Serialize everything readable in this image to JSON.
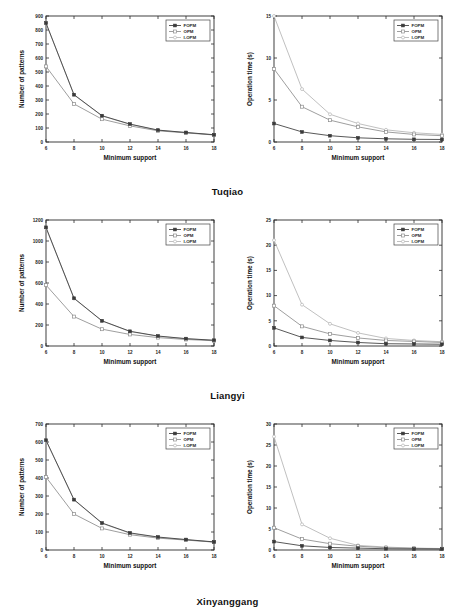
{
  "figure": {
    "x_label": "Minimum support",
    "y_label_patterns": "Number of patterns",
    "y_label_time": "Operation time (s)",
    "legend": [
      "FOPM",
      "OPM",
      "I-OPM"
    ],
    "colors": {
      "FOPM": "#3a3a3a",
      "OPM": "#8c8c8c",
      "I-OPM": "#b5b5b5",
      "axis": "#2b2b2b",
      "background": "#ffffff"
    },
    "captions": [
      "Tuqiao",
      "Liangyi",
      "Xinyanggang"
    ]
  },
  "chart_data": [
    {
      "type": "line",
      "panel": "tuqiao-patterns",
      "title": "",
      "dataset": "Tuqiao",
      "xlabel": "Minimum support",
      "ylabel": "Number of patterns",
      "x": [
        6,
        8,
        10,
        12,
        14,
        16,
        18
      ],
      "xlim": [
        6,
        18
      ],
      "ylim": [
        0,
        900
      ],
      "xticks": [
        6,
        8,
        10,
        12,
        14,
        16,
        18
      ],
      "yticks": [
        0,
        100,
        200,
        300,
        400,
        500,
        600,
        700,
        800,
        900
      ],
      "grid": false,
      "legend_position": "top-right",
      "series": [
        {
          "name": "FOPM",
          "values": [
            850,
            338,
            188,
            128,
            85,
            68,
            52
          ]
        },
        {
          "name": "OPM",
          "values": [
            540,
            272,
            163,
            115,
            80,
            65,
            50
          ]
        },
        {
          "name": "I-OPM",
          "values": [
            848,
            336,
            186,
            126,
            84,
            67,
            51
          ]
        }
      ]
    },
    {
      "type": "line",
      "panel": "tuqiao-time",
      "title": "",
      "dataset": "Tuqiao",
      "xlabel": "Minimum support",
      "ylabel": "Operation time (s)",
      "x": [
        6,
        8,
        10,
        12,
        14,
        16,
        18
      ],
      "xlim": [
        6,
        18
      ],
      "ylim": [
        0,
        15
      ],
      "xticks": [
        6,
        8,
        10,
        12,
        14,
        16,
        18
      ],
      "yticks": [
        0,
        5,
        10,
        15
      ],
      "grid": false,
      "legend_position": "top-right",
      "series": [
        {
          "name": "FOPM",
          "values": [
            2.2,
            1.2,
            0.75,
            0.5,
            0.38,
            0.32,
            0.3
          ]
        },
        {
          "name": "OPM",
          "values": [
            8.7,
            4.2,
            2.6,
            1.8,
            1.2,
            0.9,
            0.75
          ]
        },
        {
          "name": "I-OPM",
          "values": [
            15.0,
            6.3,
            3.3,
            2.2,
            1.45,
            1.1,
            0.9
          ]
        }
      ]
    },
    {
      "type": "line",
      "panel": "liangyi-patterns",
      "title": "",
      "dataset": "Liangyi",
      "xlabel": "Minimum support",
      "ylabel": "Number of patterns",
      "x": [
        6,
        8,
        10,
        12,
        14,
        16,
        18
      ],
      "xlim": [
        6,
        18
      ],
      "ylim": [
        0,
        1200
      ],
      "xticks": [
        6,
        8,
        10,
        12,
        14,
        16,
        18
      ],
      "yticks": [
        0,
        200,
        400,
        600,
        800,
        1000,
        1200
      ],
      "grid": false,
      "legend_position": "top-right",
      "series": [
        {
          "name": "FOPM",
          "values": [
            1130,
            455,
            240,
            140,
            95,
            70,
            55
          ]
        },
        {
          "name": "OPM",
          "values": [
            580,
            280,
            160,
            110,
            80,
            62,
            50
          ]
        },
        {
          "name": "I-OPM",
          "values": [
            1125,
            452,
            238,
            138,
            93,
            69,
            54
          ]
        }
      ]
    },
    {
      "type": "line",
      "panel": "liangyi-time",
      "title": "",
      "dataset": "Liangyi",
      "xlabel": "Minimum support",
      "ylabel": "Operation time (s)",
      "x": [
        6,
        8,
        10,
        12,
        14,
        16,
        18
      ],
      "xlim": [
        6,
        18
      ],
      "ylim": [
        0,
        25
      ],
      "xticks": [
        6,
        8,
        10,
        12,
        14,
        16,
        18
      ],
      "yticks": [
        0,
        5,
        10,
        15,
        20,
        25
      ],
      "grid": false,
      "legend_position": "top-right",
      "series": [
        {
          "name": "FOPM",
          "values": [
            3.6,
            1.7,
            1.1,
            0.7,
            0.45,
            0.4,
            0.35
          ]
        },
        {
          "name": "OPM",
          "values": [
            8.0,
            3.9,
            2.4,
            1.6,
            1.1,
            0.9,
            0.7
          ]
        },
        {
          "name": "I-OPM",
          "values": [
            21.0,
            8.2,
            4.4,
            2.6,
            1.5,
            1.1,
            0.85
          ]
        }
      ]
    },
    {
      "type": "line",
      "panel": "xinyanggang-patterns",
      "title": "",
      "dataset": "Xinyanggang",
      "xlabel": "Minimum support",
      "ylabel": "Number of patterns",
      "x": [
        6,
        8,
        10,
        12,
        14,
        16,
        18
      ],
      "xlim": [
        6,
        18
      ],
      "ylim": [
        0,
        700
      ],
      "xticks": [
        6,
        8,
        10,
        12,
        14,
        16,
        18
      ],
      "yticks": [
        0,
        100,
        200,
        300,
        400,
        500,
        600,
        700
      ],
      "grid": false,
      "legend_position": "top-right",
      "series": [
        {
          "name": "FOPM",
          "values": [
            610,
            280,
            150,
            95,
            72,
            58,
            45
          ]
        },
        {
          "name": "OPM",
          "values": [
            405,
            200,
            120,
            85,
            66,
            55,
            44
          ]
        },
        {
          "name": "I-OPM",
          "values": [
            608,
            278,
            148,
            93,
            70,
            57,
            44
          ]
        }
      ]
    },
    {
      "type": "line",
      "panel": "xinyanggang-time",
      "title": "",
      "dataset": "Xinyanggang",
      "xlabel": "Minimum support",
      "ylabel": "Operation time (s)",
      "x": [
        6,
        8,
        10,
        12,
        14,
        16,
        18
      ],
      "xlim": [
        6,
        18
      ],
      "ylim": [
        0,
        30
      ],
      "xticks": [
        6,
        8,
        10,
        12,
        14,
        16,
        18
      ],
      "yticks": [
        0,
        5,
        10,
        15,
        20,
        25,
        30
      ],
      "grid": false,
      "legend_position": "top-right",
      "series": [
        {
          "name": "FOPM",
          "values": [
            2.0,
            1.0,
            0.6,
            0.45,
            0.3,
            0.25,
            0.22
          ]
        },
        {
          "name": "OPM",
          "values": [
            5.3,
            2.6,
            1.5,
            0.9,
            0.55,
            0.4,
            0.3
          ]
        },
        {
          "name": "I-OPM",
          "values": [
            27.0,
            6.1,
            2.8,
            1.1,
            0.7,
            0.45,
            0.35
          ]
        }
      ]
    }
  ]
}
